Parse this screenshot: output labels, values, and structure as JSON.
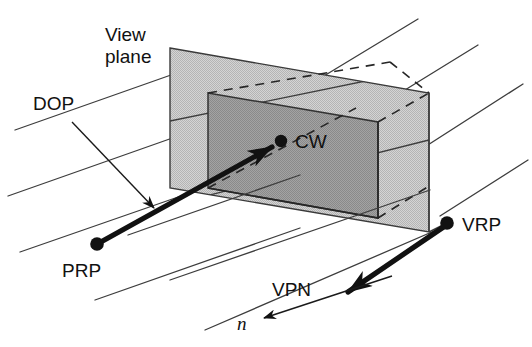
{
  "figure": {
    "background_color": "#ffffff",
    "ink_color": "#111111",
    "view_plane_fill": "#c9c9c9",
    "window_fill": "#9a9a9a",
    "edge_color": "#3a3a3a",
    "grid_color": "#444444"
  },
  "labels": {
    "view_plane_line1": "View",
    "view_plane_line2": "plane",
    "dop": "DOP",
    "cw": "CW",
    "prp": "PRP",
    "vrp": "VRP",
    "vpn": "VPN",
    "n": "n"
  },
  "points": {
    "cw": {
      "x": 281,
      "y": 141,
      "label": "CW"
    },
    "prp": {
      "x": 97,
      "y": 244,
      "label": "PRP"
    },
    "vrp": {
      "x": 447,
      "y": 223,
      "label": "VRP"
    }
  },
  "geometry": {
    "view_plane_quad": "170,48 429,93 429,232 170,188",
    "window_quad": "208,93 378,122 378,218 208,188",
    "grid_line_count": 8
  },
  "vectors": {
    "dop": {
      "from": "PRP",
      "to": "CW",
      "style": "thick-arrow"
    },
    "vpn": {
      "from": "VRP",
      "to": "n",
      "style": "thick-arrow"
    },
    "n": {
      "style": "thin-arrow"
    }
  }
}
